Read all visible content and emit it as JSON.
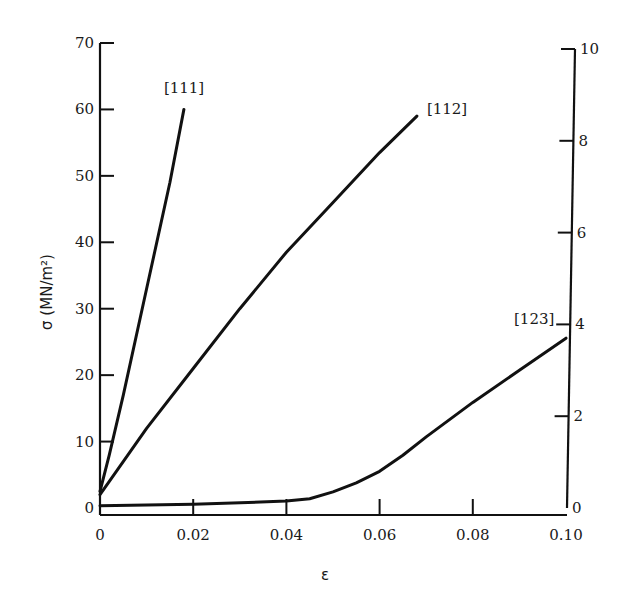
{
  "chart_data": {
    "type": "line",
    "title": "",
    "xlabel": "ε",
    "ylabel": "σ (MN/m²)",
    "ylabel_right": "",
    "xlim": [
      0,
      0.1
    ],
    "ylim": [
      0,
      70
    ],
    "ylim_right": [
      0,
      10
    ],
    "grid": false,
    "legend": "inline labels at curve ends",
    "x_ticks": [
      "0",
      "0.02",
      "0.04",
      "0.06",
      "0.08",
      "0.10"
    ],
    "x_tick_values": [
      0,
      0.02,
      0.04,
      0.06,
      0.08,
      0.1
    ],
    "y_ticks_left": [
      "0",
      "10",
      "20",
      "30",
      "40",
      "50",
      "60",
      "70"
    ],
    "y_tick_values_left": [
      0,
      10,
      20,
      30,
      40,
      50,
      60,
      70
    ],
    "y_ticks_right": [
      "0",
      "2",
      "4",
      "6",
      "8",
      "10"
    ],
    "y_tick_values_right": [
      0,
      2,
      4,
      6,
      8,
      10
    ],
    "series": [
      {
        "name": "[111]",
        "axis": "left",
        "x": [
          0,
          0.002,
          0.005,
          0.01,
          0.015,
          0.018
        ],
        "y": [
          2.5,
          8,
          17,
          33,
          49,
          60
        ]
      },
      {
        "name": "[112]",
        "axis": "left",
        "x": [
          0,
          0.01,
          0.02,
          0.03,
          0.04,
          0.05,
          0.06,
          0.068
        ],
        "y": [
          2,
          12,
          21,
          30,
          38.5,
          46,
          53.5,
          59
        ]
      },
      {
        "name": "[123]",
        "axis": "right",
        "x": [
          0,
          0.02,
          0.04,
          0.045,
          0.05,
          0.055,
          0.06,
          0.065,
          0.07,
          0.08,
          0.09,
          0.1
        ],
        "y": [
          0.05,
          0.08,
          0.15,
          0.2,
          0.35,
          0.55,
          0.8,
          1.15,
          1.55,
          2.3,
          3.0,
          3.7
        ]
      }
    ]
  }
}
